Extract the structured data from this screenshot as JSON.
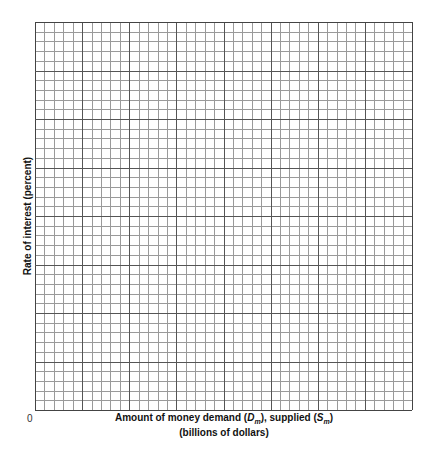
{
  "chart_data": {
    "type": "line",
    "title": "",
    "xlabel": "Amount of money demand (Dm), supplied (Sm)",
    "xlabel_line2": "(billions of dollars)",
    "ylabel": "Rate of interest (percent)",
    "origin_label": "0",
    "series": [],
    "grid": true,
    "grid_major_cols": 8,
    "grid_major_rows": 8,
    "grid_minor_per_major": 5,
    "legend": null
  },
  "labels": {
    "ylabel": "Rate of interest (percent)",
    "origin": "0",
    "x_part1": "Amount of money demand (",
    "x_dm_main": "D",
    "x_dm_sub": "m",
    "x_part2": "), supplied (",
    "x_sm_main": "S",
    "x_sm_sub": "m",
    "x_part3": ")",
    "x_line2": "(billions of dollars)"
  },
  "colors": {
    "major_line": "#555555",
    "minor_line": "#9a9a9a",
    "border": "#444444"
  }
}
